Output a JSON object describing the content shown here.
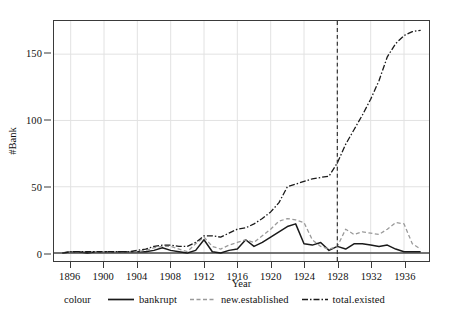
{
  "chart_data": {
    "type": "line",
    "title": "",
    "xlabel": "Year",
    "ylabel": "#Bank",
    "xlim": [
      1894,
      1939
    ],
    "ylim": [
      -6,
      175
    ],
    "xticks": [
      1896,
      1900,
      1904,
      1908,
      1912,
      1916,
      1920,
      1924,
      1928,
      1932,
      1936
    ],
    "yticks": [
      0,
      50,
      100,
      150
    ],
    "grid": true,
    "legend_position": "bottom",
    "legend_title": "colour",
    "annotations": [
      {
        "type": "vline",
        "x": 1928,
        "style": "dashed",
        "colour": "#333333"
      }
    ],
    "x": [
      1895,
      1896,
      1897,
      1898,
      1899,
      1900,
      1901,
      1902,
      1903,
      1904,
      1905,
      1906,
      1907,
      1908,
      1909,
      1910,
      1911,
      1912,
      1913,
      1914,
      1915,
      1916,
      1917,
      1918,
      1919,
      1920,
      1921,
      1922,
      1923,
      1924,
      1925,
      1926,
      1927,
      1928,
      1929,
      1930,
      1931,
      1932,
      1933,
      1934,
      1935,
      1936,
      1937,
      1938
    ],
    "series": [
      {
        "name": "bankrupt",
        "style": "solid",
        "colour": "#1a1a1a",
        "values": [
          0,
          1,
          1,
          0,
          1,
          1,
          1,
          1,
          1,
          1,
          1,
          2,
          4,
          2,
          1,
          0,
          2,
          10,
          1,
          0,
          2,
          3,
          10,
          5,
          8,
          12,
          16,
          20,
          22,
          7,
          6,
          8,
          2,
          5,
          3,
          7,
          7,
          6,
          5,
          6,
          3,
          1,
          1,
          1
        ]
      },
      {
        "name": "new.established",
        "style": "dashed",
        "colour": "#9a9a9a",
        "values": [
          0,
          1,
          1,
          1,
          1,
          1,
          1,
          1,
          1,
          1,
          2,
          4,
          5,
          5,
          3,
          1,
          7,
          12,
          5,
          3,
          6,
          8,
          10,
          8,
          13,
          18,
          24,
          26,
          25,
          23,
          10,
          5,
          3,
          5,
          18,
          14,
          16,
          15,
          14,
          18,
          23,
          22,
          7,
          3
        ]
      },
      {
        "name": "total.existed",
        "style": "dashdot",
        "colour": "#1a1a1a",
        "values": [
          0,
          1,
          1,
          1,
          1,
          1,
          1,
          1,
          1,
          2,
          3,
          5,
          6,
          6,
          5,
          5,
          8,
          13,
          13,
          12,
          15,
          18,
          19,
          22,
          26,
          31,
          38,
          50,
          52,
          54,
          56,
          57,
          58,
          68,
          82,
          93,
          104,
          116,
          130,
          148,
          158,
          164,
          167,
          168
        ]
      }
    ]
  },
  "legend": {
    "title": "colour",
    "entries": [
      {
        "label": "bankrupt",
        "key": "solid-line-key"
      },
      {
        "label": "new.established",
        "key": "dashed-line-key"
      },
      {
        "label": "total.existed",
        "key": "dashdot-line-key"
      }
    ]
  }
}
